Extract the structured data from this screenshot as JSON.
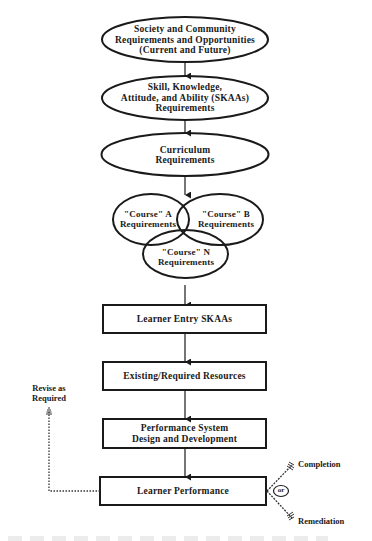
{
  "diagram": {
    "nodes": [
      {
        "id": "society",
        "shape": "ellipse",
        "label": "Society and Community\nRequirements and Opportunities\n(Current and Future)"
      },
      {
        "id": "skaas",
        "shape": "ellipse",
        "label": "Skill, Knowledge,\nAttitude, and Ability (SKAAs)\nRequirements"
      },
      {
        "id": "curriculum",
        "shape": "ellipse",
        "label": "Curriculum\nRequirements"
      },
      {
        "id": "course-a",
        "shape": "ellipse",
        "label": "\"Course\" A\nRequirements"
      },
      {
        "id": "course-b",
        "shape": "ellipse",
        "label": "\"Course\" B\nRequirements"
      },
      {
        "id": "course-n",
        "shape": "ellipse",
        "label": "\"Course\" N\nRequirements"
      },
      {
        "id": "learner-entry",
        "shape": "box",
        "label": "Learner Entry SKAAs"
      },
      {
        "id": "resources",
        "shape": "box",
        "label": "Existing/Required Resources"
      },
      {
        "id": "perf-system",
        "shape": "box",
        "label": "Performance System\nDesign and Development"
      },
      {
        "id": "learner-perf",
        "shape": "box",
        "label": "Learner Performance"
      }
    ],
    "feedback": {
      "label": "Revise as\nRequired"
    },
    "outcomes": {
      "connector": "or",
      "completion": "Completion",
      "remediation": "Remediation"
    },
    "colors": {
      "stroke": "#1a1a1a",
      "background": "#ffffff"
    }
  }
}
